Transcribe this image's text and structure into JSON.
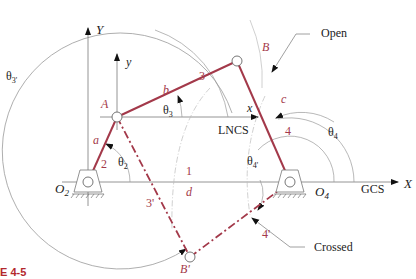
{
  "figure": {
    "caption": "E 4-5",
    "colors": {
      "link": "#a3394a",
      "axis": "#8a8a8a",
      "text": "#222222",
      "caption": "#b3282d"
    }
  },
  "labels": {
    "global_Y": "Y",
    "global_X": "X",
    "gcs": "GCS",
    "local_y": "y",
    "local_x": "x",
    "lncs": "LNCS",
    "point_A": "A",
    "point_B": "B",
    "point_B_prime": "B'",
    "pivot_O2": "O",
    "pivot_O2_sub": "2",
    "pivot_O4": "O",
    "pivot_O4_sub": "4",
    "link_a": "a",
    "link_b": "b",
    "link_c": "c",
    "link_d": "d",
    "link_num_1": "1",
    "link_num_2": "2",
    "link_num_3": "3",
    "link_num_4": "4",
    "link_num_3p": "3'",
    "link_num_4p": "4'",
    "theta2": "θ",
    "theta2_sub": "2",
    "theta3": "θ",
    "theta3_sub": "3",
    "theta4": "θ",
    "theta4_sub": "4",
    "theta3p": "θ",
    "theta3p_sub": "3'",
    "theta4p": "θ",
    "theta4p_sub": "4'",
    "open": "Open",
    "crossed": "Crossed"
  }
}
